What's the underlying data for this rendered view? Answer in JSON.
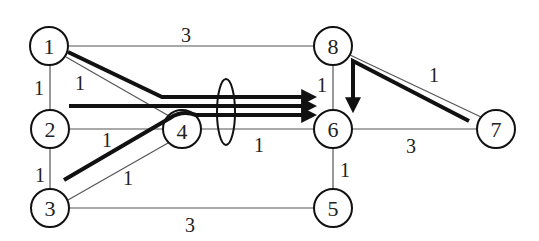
{
  "diagram": {
    "type": "network-graph",
    "nodes": [
      {
        "id": "1",
        "label": "1",
        "x": 49,
        "y": 46
      },
      {
        "id": "2",
        "label": "2",
        "x": 50,
        "y": 129
      },
      {
        "id": "3",
        "label": "3",
        "x": 50,
        "y": 208
      },
      {
        "id": "4",
        "label": "4",
        "x": 182,
        "y": 129
      },
      {
        "id": "5",
        "label": "5",
        "x": 333,
        "y": 208
      },
      {
        "id": "6",
        "label": "6",
        "x": 333,
        "y": 129
      },
      {
        "id": "7",
        "label": "7",
        "x": 496,
        "y": 129
      },
      {
        "id": "8",
        "label": "8",
        "x": 333,
        "y": 46
      }
    ],
    "edges": [
      {
        "from": "1",
        "to": "8",
        "weight": "3",
        "label_x": 186,
        "label_y": 35
      },
      {
        "from": "1",
        "to": "2",
        "weight": "1",
        "label_x": 39,
        "label_y": 88
      },
      {
        "from": "1",
        "to": "4",
        "weight": "1",
        "label_x": 80,
        "label_y": 83
      },
      {
        "from": "2",
        "to": "4",
        "weight": "1",
        "label_x": 107,
        "label_y": 140
      },
      {
        "from": "2",
        "to": "3",
        "weight": "1",
        "label_x": 40,
        "label_y": 175
      },
      {
        "from": "3",
        "to": "4",
        "weight": "1",
        "label_x": 128,
        "label_y": 178
      },
      {
        "from": "3",
        "to": "5",
        "weight": "3",
        "label_x": 190,
        "label_y": 225
      },
      {
        "from": "4",
        "to": "6",
        "weight": "1",
        "label_x": 259,
        "label_y": 145
      },
      {
        "from": "8",
        "to": "6",
        "weight": "1",
        "label_x": 322,
        "label_y": 85
      },
      {
        "from": "8",
        "to": "7",
        "weight": "1",
        "label_x": 434,
        "label_y": 75
      },
      {
        "from": "6",
        "to": "7",
        "weight": "3",
        "label_x": 411,
        "label_y": 146
      },
      {
        "from": "6",
        "to": "5",
        "weight": "1",
        "label_x": 345,
        "label_y": 170
      }
    ],
    "flows": [
      {
        "name": "flow-1-to-6",
        "path": "1 -> 4 -> 6"
      },
      {
        "name": "flow-2-to-6",
        "path": "2 -> 6"
      },
      {
        "name": "flow-3-to-6",
        "path": "3 -> 4 -> 6"
      },
      {
        "name": "flow-7-to-6",
        "path": "7 -> 8 -> 6"
      }
    ],
    "annotation": {
      "shape": "ellipse",
      "cx": 226,
      "cy": 112,
      "rx": 9,
      "ry": 33,
      "meaning": "bundle of flows crossing link 4-6"
    },
    "colors": {
      "node_stroke": "#111111",
      "edge": "#555555",
      "flow": "#111111",
      "background": "#ffffff"
    }
  }
}
